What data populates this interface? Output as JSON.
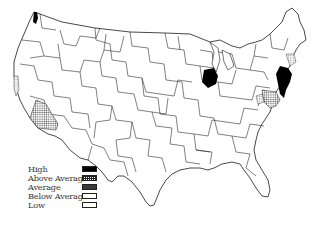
{
  "map": {
    "type": "choropleth",
    "region": "Contiguous United States",
    "subdivision": "regional districts",
    "highlighted_regions": [
      {
        "name": "Northern Illinois (Chicago area)",
        "level": "High"
      },
      {
        "name": "New York / New Jersey metro",
        "level": "High"
      },
      {
        "name": "Western Washington (Seattle area)",
        "level": "High"
      },
      {
        "name": "Southern California",
        "level": "Above Average"
      },
      {
        "name": "Mid-Atlantic (Washington DC / Baltimore)",
        "level": "Above Average"
      },
      {
        "name": "Northern California coast",
        "level": "Below Average"
      },
      {
        "name": "New England coast",
        "level": "Below Average"
      }
    ]
  },
  "legend": {
    "items": [
      {
        "label": "High",
        "fill": "#000000",
        "pattern": "solid"
      },
      {
        "label": "Above Average",
        "fill": "#222222",
        "pattern": "crosshatch"
      },
      {
        "label": "Average",
        "fill": "#444444",
        "pattern": "dense"
      },
      {
        "label": "Below Average",
        "fill": "#888888",
        "pattern": "light-crosshatch"
      },
      {
        "label": "Low",
        "fill": "#ffffff",
        "pattern": "none"
      }
    ]
  },
  "colors": {
    "background": "#ffffff",
    "border": "#1a1a1a",
    "high": "#000000"
  }
}
